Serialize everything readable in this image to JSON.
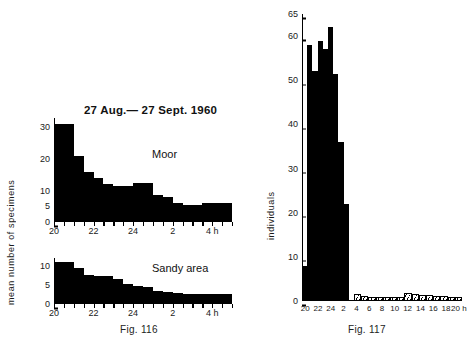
{
  "figure": {
    "background": "#ffffff",
    "ink": "#000000"
  },
  "fig116": {
    "caption": "Fig. 116",
    "title": "27 Aug.— 27 Sept. 1960",
    "ylabel": "mean number of specimens",
    "annotation_top": "Moor",
    "annotation_bottom": "Sandy area"
  },
  "fig117": {
    "caption": "Fig. 117",
    "ylabel": "individuals"
  },
  "chart_data": [
    {
      "type": "bar",
      "id": "fig116-moor",
      "title": "27 Aug.— 27 Sept. 1960",
      "annotation": "Moor",
      "xlabel": "h",
      "ylabel": "mean number of specimens",
      "ylim": [
        0,
        33
      ],
      "yticks": [
        0,
        5,
        10,
        20,
        30
      ],
      "grid": false,
      "legend": "none",
      "x": [
        "20",
        "",
        "21",
        "",
        "22",
        "",
        "23",
        "",
        "24",
        "",
        "1",
        "",
        "2",
        "",
        "3",
        "",
        "4",
        ""
      ],
      "xtick_labels": [
        "20",
        "22",
        "24",
        "2",
        "4 h"
      ],
      "xtick_positions": [
        0,
        4,
        8,
        12,
        16
      ],
      "categories": [
        "20:00",
        "20:30",
        "21:00",
        "21:30",
        "22:00",
        "22:30",
        "23:00",
        "23:30",
        "24:00",
        "00:30",
        "01:00",
        "01:30",
        "02:00",
        "02:30",
        "03:00",
        "03:30",
        "04:00",
        "04:30"
      ],
      "values": [
        31,
        31,
        21,
        16,
        14,
        12,
        11.5,
        11.5,
        12.5,
        12.5,
        8.5,
        8,
        6,
        5.5,
        5.5,
        6,
        6,
        6
      ]
    },
    {
      "type": "bar",
      "id": "fig116-sandy",
      "annotation": "Sandy area",
      "xlabel": "h",
      "ylabel": "mean number of specimens",
      "ylim": [
        0,
        12
      ],
      "yticks": [
        0,
        5,
        10
      ],
      "grid": false,
      "legend": "none",
      "xtick_labels": [
        "20",
        "22",
        "24",
        "2",
        "4 h"
      ],
      "xtick_positions": [
        0,
        4,
        8,
        12,
        16
      ],
      "categories": [
        "20:00",
        "20:30",
        "21:00",
        "21:30",
        "22:00",
        "22:30",
        "23:00",
        "23:30",
        "24:00",
        "00:30",
        "01:00",
        "01:30",
        "02:00",
        "02:30",
        "03:00",
        "03:30",
        "04:00",
        "04:30"
      ],
      "values": [
        11,
        11,
        9.3,
        7.6,
        7.3,
        7.2,
        6.6,
        5.2,
        4.6,
        4.5,
        3.4,
        3.2,
        2.8,
        2.6,
        2.6,
        2.5,
        2.5,
        2.5
      ]
    },
    {
      "type": "bar",
      "id": "fig117",
      "ylabel": "individuals",
      "xlabel": "h",
      "ylim": [
        0,
        65
      ],
      "yticks": [
        0,
        10,
        20,
        30,
        40,
        50,
        60,
        65
      ],
      "grid": false,
      "legend": "none",
      "xtick_labels": [
        "20",
        "22",
        "24",
        "2",
        "4",
        "6",
        "8",
        "10",
        "12",
        "14",
        "16",
        "18",
        "20 h"
      ],
      "categories": [
        "20",
        "21",
        "22",
        "23",
        "24",
        "1",
        "2",
        "3",
        "4",
        "5",
        "6",
        "7",
        "8",
        "9",
        "10",
        "11",
        "12",
        "13",
        "14",
        "15",
        "16",
        "17",
        "18",
        "19",
        "20"
      ],
      "values": [
        8,
        58,
        52,
        59,
        57,
        62,
        51.5,
        36,
        22,
        0,
        1.5,
        1.2,
        1.0,
        0.9,
        0.8,
        0.7,
        0.6,
        1.8,
        1.6,
        1.4,
        1.3,
        1.2,
        1.1,
        1.0,
        0.9
      ],
      "bar_styles": [
        "solid",
        "solid",
        "solid",
        "solid",
        "solid",
        "solid",
        "solid",
        "solid",
        "solid",
        "none",
        "hatched",
        "hatched",
        "hatched",
        "hatched",
        "hatched",
        "hatched",
        "hatched",
        "hatched",
        "hatched",
        "hatched",
        "hatched",
        "hatched",
        "hatched",
        "hatched",
        "hatched"
      ]
    }
  ]
}
